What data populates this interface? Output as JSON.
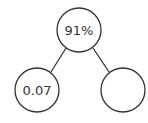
{
  "diagram": {
    "type": "number-bond",
    "colors": {
      "stroke": "#333333",
      "fill": "#ffffff",
      "text": "#333333"
    },
    "nodes": [
      {
        "id": "whole",
        "label": "91%",
        "cx": 79,
        "cy": 30,
        "r": 22
      },
      {
        "id": "part-left",
        "label": "0.07",
        "cx": 37,
        "cy": 90,
        "r": 22
      },
      {
        "id": "part-right",
        "label": "",
        "cx": 123,
        "cy": 90,
        "r": 22
      }
    ],
    "edges": [
      {
        "from": "whole",
        "to": "part-left"
      },
      {
        "from": "whole",
        "to": "part-right"
      }
    ]
  }
}
